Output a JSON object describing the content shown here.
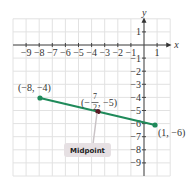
{
  "chart_data": {
    "type": "line",
    "title": "",
    "xlabel": "x",
    "ylabel": "y",
    "xlim": [
      -10,
      2
    ],
    "ylim": [
      -10,
      2
    ],
    "grid": true,
    "x_ticks": [
      "-9",
      "-8",
      "-7",
      "-6",
      "-5",
      "-4",
      "-3",
      "-2",
      "-1",
      "1"
    ],
    "y_ticks": [
      "1",
      "-1",
      "-2",
      "-3",
      "-4",
      "-5",
      "-6",
      "-7",
      "-8",
      "-9"
    ],
    "series": [
      {
        "name": "segment",
        "color": "#1f8a5a",
        "points": [
          [
            -8,
            -4
          ],
          [
            1,
            -6
          ]
        ]
      }
    ],
    "midpoint": {
      "x": -3.5,
      "y": -5
    },
    "annotations": [
      {
        "text": "(−8, −4)",
        "x": -8,
        "y": -4
      },
      {
        "text": "(1, −6)",
        "x": 1,
        "y": -6
      },
      {
        "text": "(−7/2, −5)",
        "x": -3.5,
        "y": -5
      },
      {
        "text": "Midpoint",
        "x": -3.5,
        "y": -7
      }
    ]
  },
  "labels": {
    "x_axis": "x",
    "y_axis": "y",
    "p1": "(−8, −4)",
    "p2": "(1, −6)",
    "mid_open": "(−",
    "mid_num": "7",
    "mid_den": "2",
    "mid_close": ", −5)",
    "callout": "Midpoint"
  }
}
